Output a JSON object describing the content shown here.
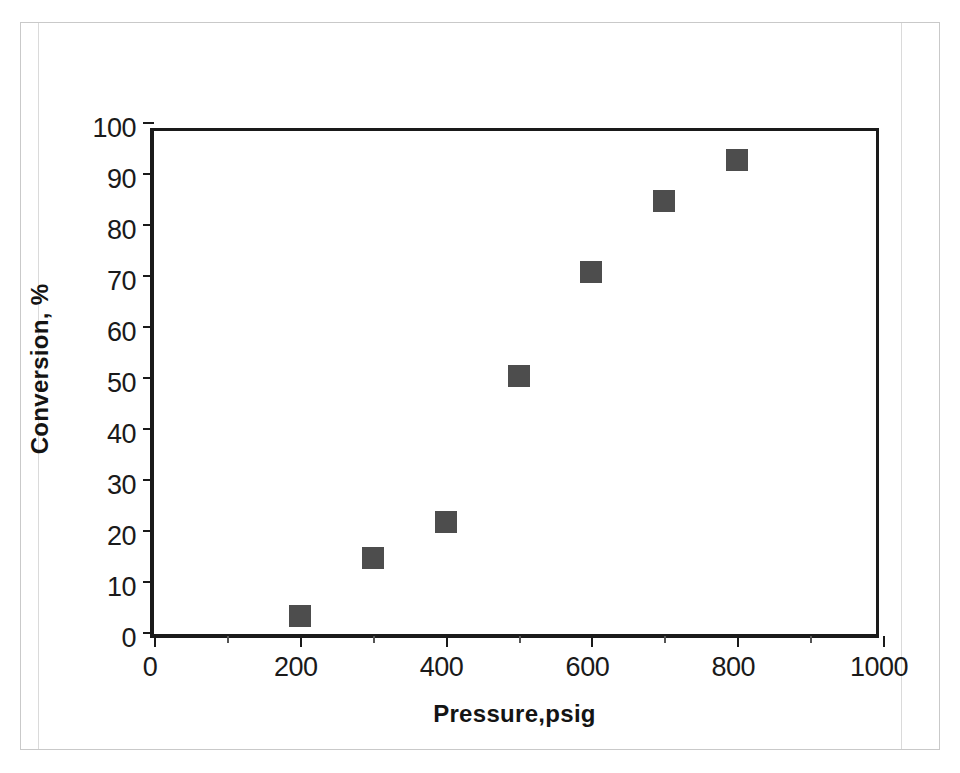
{
  "figure": {
    "background_color": "#ffffff",
    "frame_color": "#c9c9c9",
    "axis_color": "#1a1a1a",
    "marker_color": "#4d4d4d"
  },
  "chart_data": {
    "type": "scatter",
    "title": "",
    "xlabel": "Pressure,psig",
    "ylabel": "Conversion, %",
    "xlim": [
      0,
      1000
    ],
    "ylim": [
      0,
      100
    ],
    "grid": false,
    "legend": null,
    "x_major_ticks": [
      0,
      200,
      400,
      600,
      800,
      1000
    ],
    "x_minor_ticks": [
      100,
      300,
      500,
      700,
      900
    ],
    "x_tick_labels": [
      "0",
      "200",
      "400",
      "600",
      "800",
      "1000"
    ],
    "y_major_ticks": [
      0,
      10,
      20,
      30,
      40,
      50,
      60,
      70,
      80,
      90,
      100
    ],
    "y_tick_labels": [
      "0",
      "10",
      "20",
      "30",
      "40",
      "50",
      "60",
      "70",
      "80",
      "90",
      "100"
    ],
    "marker": "square",
    "marker_size_px": 22,
    "series": [
      {
        "name": "Conversion vs Pressure",
        "color": "#4d4d4d",
        "points": [
          {
            "x": 200,
            "y": 3.5
          },
          {
            "x": 300,
            "y": 15.0
          },
          {
            "x": 400,
            "y": 22.0
          },
          {
            "x": 500,
            "y": 50.5
          },
          {
            "x": 600,
            "y": 71.0
          },
          {
            "x": 700,
            "y": 85.0
          },
          {
            "x": 800,
            "y": 93.0
          }
        ]
      }
    ],
    "x": [
      200,
      300,
      400,
      500,
      600,
      700,
      800
    ],
    "values": [
      3.5,
      15.0,
      22.0,
      50.5,
      71.0,
      85.0,
      93.0
    ]
  }
}
